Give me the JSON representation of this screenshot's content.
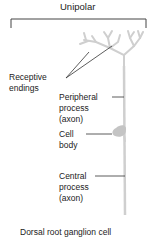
{
  "diagram": {
    "title": "Unipolar",
    "caption": "Dorsal root ganglion cell",
    "labels": {
      "receptive_endings": [
        "Receptive",
        "endings"
      ],
      "peripheral_process": [
        "Peripheral",
        "process",
        "(axon)"
      ],
      "cell_body": [
        "Cell",
        "body"
      ],
      "central_process": [
        "Central",
        "process",
        "(axon)"
      ]
    },
    "colors": {
      "neuron": "#c8c8c8",
      "leader": "#333333",
      "bracket": "#444444"
    }
  }
}
